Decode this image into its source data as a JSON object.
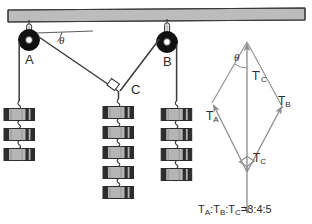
{
  "figure": {
    "beam": {
      "name": "ceiling-beam",
      "fill": "#b9b9b9",
      "stroke": "#333333"
    },
    "angle_symbol": "θ",
    "pulleys": [
      {
        "id": "A",
        "label": "A",
        "cx": 29,
        "cy": 40,
        "r": 10,
        "fill": "#111111"
      },
      {
        "id": "B",
        "label": "B",
        "cx": 167,
        "cy": 42,
        "r": 10,
        "fill": "#111111"
      }
    ],
    "junction": {
      "id": "C",
      "label": "C",
      "x": 118,
      "y": 91,
      "right_angle": true
    },
    "weight_stacks": [
      {
        "id": "A",
        "count": 3,
        "label": "weights-under-pulley-a"
      },
      {
        "id": "C",
        "count": 5,
        "label": "weights-under-junction-c"
      },
      {
        "id": "B",
        "count": 4,
        "label": "weights-under-pulley-b"
      }
    ],
    "weight_block": {
      "fill_light": "#b5b5b5",
      "fill_dark": "#2d2d2d",
      "width": 30,
      "height": 11
    }
  },
  "vector_diagram": {
    "name": "force-parallelogram",
    "angle_symbol": "θ",
    "vectors": [
      {
        "name": "tension-a",
        "base": "T",
        "sub": "A",
        "prime": false
      },
      {
        "name": "tension-b",
        "base": "T",
        "sub": "B",
        "prime": false
      },
      {
        "name": "tension-c-resultant",
        "base": "T",
        "sub": "C",
        "prime": true
      },
      {
        "name": "tension-c-weight",
        "base": "T",
        "sub": "C",
        "prime": false
      }
    ],
    "right_angle_marker": true
  },
  "equation": {
    "name": "tension-ratio-equation",
    "terms": [
      "T",
      "A",
      "T",
      "B",
      "T",
      "C"
    ],
    "t1": "T",
    "s1": "A",
    "t2": "T",
    "s2": "B",
    "t3": "T",
    "s3": "C",
    "colon1": ":",
    "colon2": ":",
    "equals": "=",
    "ratio": "3:4:5",
    "full_text": "Tᴀ : Tʙ : Tᴄ = 3:4:5"
  },
  "colors": {
    "line": "#3a3a3a",
    "beam_fill": "#b9b9b9",
    "pulley": "#111111",
    "text": "#2b2b2b",
    "vector_line": "#8d8d8d",
    "background": "#ffffff"
  }
}
